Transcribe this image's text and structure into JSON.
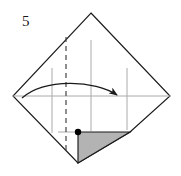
{
  "figure": {
    "kind": "origami-fold-diagram",
    "step_number": "5",
    "caption": "",
    "canvas": {
      "width": 181,
      "height": 176,
      "background": "#ffffff"
    },
    "colors": {
      "outline": "#1a1a1a",
      "crease_line": "#aaaaaa",
      "fold_line_dashed": "#444444",
      "shaded_flap_fill": "#b3b3b3",
      "shaded_flap_stroke": "#1a1a1a",
      "arrow": "#1a1a1a",
      "dot": "#000000",
      "paper_fill": "#ffffff"
    },
    "shapes": {
      "paper_outline": {
        "name": "rotated-square-sheet",
        "points": "91,13 170,96 130,132 78,163 13,96"
      },
      "top_vertex": {
        "x": 91,
        "y": 13
      },
      "right_vertex": {
        "x": 170,
        "y": 96
      },
      "left_vertex": {
        "x": 13,
        "y": 96
      },
      "bottom_vertex": {
        "x": 78,
        "y": 163
      },
      "flap_corner": {
        "x": 130,
        "y": 132
      }
    },
    "creases": {
      "horizontal": {
        "x1": 13,
        "y1": 96,
        "x2": 170,
        "y2": 96
      },
      "vertical_left": {
        "x": 52,
        "y1": 68,
        "y2": 133
      },
      "vertical_center": {
        "x": 91,
        "y1": 40,
        "y2": 131
      },
      "vertical_right": {
        "x": 127,
        "y1": 68,
        "y2": 130
      },
      "flap_guide": {
        "x1": 58,
        "y1": 132,
        "x2": 78,
        "y2": 132
      }
    },
    "fold_line": {
      "type": "valley-fold-dashed",
      "x": 66,
      "y1": 37,
      "y2": 150,
      "dash_pattern": "5 4"
    },
    "arrow": {
      "type": "curved-fold-arrow",
      "direction": "left-to-right",
      "path": "M 22,98 C 45,78 95,80 117,95",
      "head_at": {
        "x": 117,
        "y": 95
      }
    },
    "shaded_flap": {
      "name": "folded-under-triangle",
      "points": "78,132 130,132 78,163",
      "fill": "#b3b3b3"
    },
    "reference_dot": {
      "x": 78,
      "y": 132,
      "r": 3.2
    }
  }
}
